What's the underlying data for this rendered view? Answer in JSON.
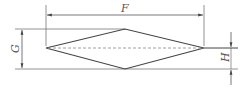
{
  "diagram": {
    "type": "technical-drawing",
    "shape": "diamond",
    "line_color": "#444444",
    "dimensions": {
      "F": {
        "label": "F",
        "description": "overall length (horizontal)"
      },
      "G": {
        "label": "G",
        "description": "overall height (vertical)"
      },
      "H": {
        "label": "H",
        "description": "half height (centerline to bottom)"
      }
    }
  }
}
